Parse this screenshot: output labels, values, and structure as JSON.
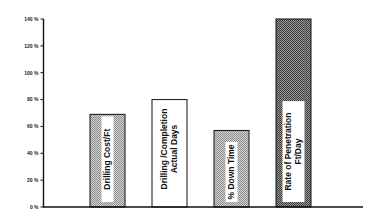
{
  "chart_data": {
    "type": "bar",
    "title": "",
    "xlabel": "",
    "ylabel": "",
    "categories": [
      "Drilling Cost/Ft",
      "Drilling /Completion Actual Days",
      "% Down Time",
      "Rate of Penetration Ft/Day"
    ],
    "values": [
      69,
      80,
      57,
      140
    ],
    "ylim": [
      0,
      140
    ],
    "yticks": [
      0,
      20,
      40,
      60,
      80,
      100,
      120,
      140
    ],
    "ytick_labels": [
      "0 %",
      "20 %",
      "40 %",
      "60 %",
      "80 %",
      "100 %",
      "120 %",
      "140 %"
    ],
    "grid": false,
    "legend": null,
    "bars": [
      {
        "label_lines": [
          "Drilling Cost/Ft"
        ],
        "value": 69,
        "fill": "light-crosshatch",
        "color": "#b8b8b8"
      },
      {
        "label_lines": [
          "Drilling /Completion",
          "Actual Days"
        ],
        "value": 80,
        "fill": "white",
        "color": "#ffffff"
      },
      {
        "label_lines": [
          "% Down Time"
        ],
        "value": 57,
        "fill": "light-crosshatch",
        "color": "#b8b8b8"
      },
      {
        "label_lines": [
          "Rate of Penetration",
          "Ft/Day"
        ],
        "value": 140,
        "fill": "dark-crosshatch",
        "color": "#6a6a6a"
      }
    ]
  }
}
